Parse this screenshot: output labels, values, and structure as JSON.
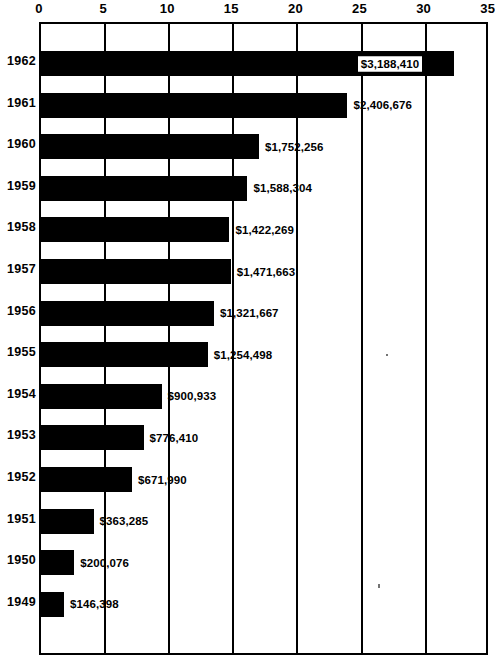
{
  "chart_data": {
    "type": "bar",
    "orientation": "horizontal",
    "title": "",
    "subtitle": "",
    "xlabel": "",
    "ylabel": "",
    "grid": true,
    "legend": null,
    "xlim": [
      0,
      35
    ],
    "x_tick_labels": [
      "0",
      "5",
      "10",
      "15",
      "20",
      "25",
      "30",
      "35"
    ],
    "x_ticks": [
      0,
      5,
      10,
      15,
      20,
      25,
      30,
      35
    ],
    "value_unit": "hundred thousand dollars",
    "categories": [
      "1962",
      "1961",
      "1960",
      "1959",
      "1958",
      "1957",
      "1956",
      "1955",
      "1954",
      "1953",
      "1952",
      "1951",
      "1950",
      "1949"
    ],
    "values": [
      32.2,
      23.9,
      17.0,
      16.1,
      14.7,
      14.8,
      13.5,
      13.0,
      9.4,
      8.0,
      7.1,
      4.1,
      2.6,
      1.8
    ],
    "data_labels": [
      "$3,188,410",
      "$2,406,676",
      "$1,752,256",
      "$1,588,304",
      "$1,422,269",
      "$1,471,663",
      "$1,321,667",
      "$1,254,498",
      "$900,933",
      "$776,410",
      "$671,990",
      "$363,285",
      "$200,076",
      "$146,398"
    ],
    "label_placement": [
      "inside-box",
      "outside",
      "outside",
      "outside",
      "outside",
      "outside",
      "outside",
      "outside",
      "outside",
      "outside",
      "outside",
      "outside",
      "outside",
      "outside"
    ],
    "colors": {
      "bar": "#000000",
      "background": "#ffffff",
      "axis": "#000000",
      "text": "#000000"
    },
    "rows": [
      {
        "category": "1962",
        "value": 32.2,
        "label": "$3,188,410",
        "placement": "inside-box"
      },
      {
        "category": "1961",
        "value": 23.9,
        "label": "$2,406,676",
        "placement": "outside"
      },
      {
        "category": "1960",
        "value": 17.0,
        "label": "$1,752,256",
        "placement": "outside"
      },
      {
        "category": "1959",
        "value": 16.1,
        "label": "$1,588,304",
        "placement": "outside"
      },
      {
        "category": "1958",
        "value": 14.7,
        "label": "$1,422,269",
        "placement": "outside"
      },
      {
        "category": "1957",
        "value": 14.8,
        "label": "$1,471,663",
        "placement": "outside"
      },
      {
        "category": "1956",
        "value": 13.5,
        "label": "$1,321,667",
        "placement": "outside"
      },
      {
        "category": "1955",
        "value": 13.0,
        "label": "$1,254,498",
        "placement": "outside"
      },
      {
        "category": "1954",
        "value": 9.4,
        "label": "$900,933",
        "placement": "outside"
      },
      {
        "category": "1953",
        "value": 8.0,
        "label": "$776,410",
        "placement": "outside"
      },
      {
        "category": "1952",
        "value": 7.1,
        "label": "$671,990",
        "placement": "outside"
      },
      {
        "category": "1951",
        "value": 4.1,
        "label": "$363,285",
        "placement": "outside"
      },
      {
        "category": "1950",
        "value": 2.6,
        "label": "$200,076",
        "placement": "outside"
      },
      {
        "category": "1949",
        "value": 1.8,
        "label": "$146,398",
        "placement": "outside"
      }
    ]
  },
  "layout": {
    "plot_left": 39,
    "plot_top": 22,
    "plot_width": 449,
    "plot_height": 633,
    "px_per_unit": 12.82,
    "first_bar_top": 27,
    "row_pitch": 41.6,
    "bar_height": 25
  }
}
